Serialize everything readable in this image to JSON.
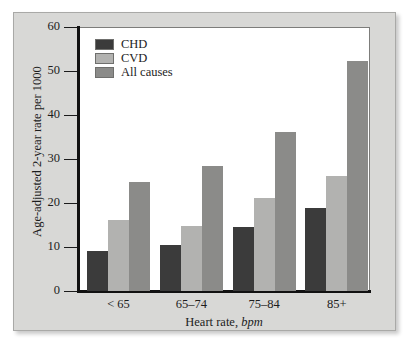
{
  "chart_data": {
    "type": "bar",
    "title": "",
    "xlabel": "Heart rate, bpm",
    "xlabel_plain": "Heart rate,",
    "xlabel_italic": "bpm",
    "ylabel": "Age-adjusted 2-year rate per 1000",
    "categories": [
      "< 65",
      "65–74",
      "75–84",
      "85+"
    ],
    "series": [
      {
        "name": "CHD",
        "color": "#3b3b3b",
        "values": [
          9.0,
          10.5,
          14.5,
          18.8
        ]
      },
      {
        "name": "CVD",
        "color": "#b2b2b0",
        "values": [
          16.1,
          14.7,
          21.2,
          26.2
        ]
      },
      {
        "name": "All causes",
        "color": "#8b8b89",
        "values": [
          24.8,
          28.3,
          36.2,
          52.2
        ]
      }
    ],
    "ylim": [
      0,
      60
    ],
    "yticks": [
      0,
      10,
      20,
      30,
      40,
      50,
      60
    ],
    "ytick_labels": [
      "0",
      "10",
      "20",
      "30",
      "40",
      "50",
      "60"
    ],
    "grid": false,
    "legend_position": "top-left",
    "legend_entries": [
      "CHD",
      "CVD",
      "All causes"
    ]
  },
  "figure": {
    "panel_background": "#d8d8d6",
    "plot_background": "#ffffff",
    "axis_color": "#111111"
  }
}
